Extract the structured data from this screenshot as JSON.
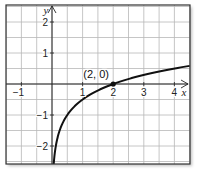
{
  "chart_data": {
    "type": "line",
    "title": "",
    "xlabel": "x",
    "ylabel": "y",
    "xlim": [
      -1.5,
      4.5
    ],
    "ylim": [
      -2.6,
      2.6
    ],
    "grid": true,
    "grid_step": 0.5,
    "x_ticks": [
      {
        "value": -1,
        "label": "−1"
      },
      {
        "value": 1,
        "label": "1"
      },
      {
        "value": 2,
        "label": "2"
      },
      {
        "value": 3,
        "label": "3"
      },
      {
        "value": 4,
        "label": "4"
      }
    ],
    "y_ticks": [
      {
        "value": 2,
        "label": "2"
      },
      {
        "value": 1,
        "label": "1"
      },
      {
        "value": -1,
        "label": "−1"
      },
      {
        "value": -2,
        "label": "−2"
      }
    ],
    "series": [
      {
        "name": "logarithmic curve",
        "color": "#111111",
        "x": [
          0.005,
          0.02,
          0.05,
          0.1,
          0.25,
          0.5,
          1,
          1.5,
          2,
          2.5,
          3,
          3.5,
          4,
          4.5
        ],
        "y": [
          -4.32,
          -3.32,
          -2.66,
          -2.16,
          -1.5,
          -1.0,
          -0.5,
          -0.21,
          0,
          0.16,
          0.29,
          0.4,
          0.5,
          0.58
        ]
      }
    ],
    "annotations": [
      {
        "x": 2,
        "y": 0,
        "label": "(2, 0)"
      }
    ],
    "colors": {
      "grid": "#b8b8b8",
      "axis": "#222222",
      "frame": "#333333",
      "curve": "#111111"
    }
  }
}
